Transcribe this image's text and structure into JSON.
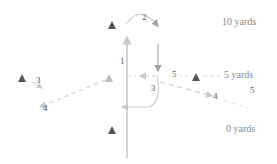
{
  "yard_markers": [
    {
      "label": "10 yards",
      "x": 222,
      "y": 19
    },
    {
      "label": "5 yards",
      "x": 224,
      "y": 71
    },
    {
      "label": "0 yards",
      "x": 226,
      "y": 124
    }
  ],
  "players": [
    {
      "id": "p-top",
      "x": 112,
      "y": 25
    },
    {
      "id": "p-left",
      "x": 22,
      "y": 78
    },
    {
      "id": "p-center-left",
      "x": 109,
      "y": 78
    },
    {
      "id": "p-right",
      "x": 196,
      "y": 77
    },
    {
      "id": "p-bottom",
      "x": 112,
      "y": 130
    }
  ],
  "step_labels": [
    {
      "text": "1",
      "x": 121,
      "y": 64
    },
    {
      "text": "2",
      "x": 144,
      "y": 21
    },
    {
      "text": "3",
      "x": 37,
      "y": 84
    },
    {
      "text": "4",
      "x": 43,
      "y": 112
    },
    {
      "text": "3",
      "x": 151,
      "y": 92
    },
    {
      "text": "4",
      "x": 213,
      "y": 100
    },
    {
      "text": "5",
      "x": 173,
      "y": 78
    },
    {
      "text": "5",
      "x": 250,
      "y": 94
    }
  ],
  "colors": {
    "player": "#555555",
    "route": "#bdbdbd",
    "route_dark": "#9a9a9a",
    "yard_text": "#8a8a8a",
    "step_text": "#555555"
  }
}
